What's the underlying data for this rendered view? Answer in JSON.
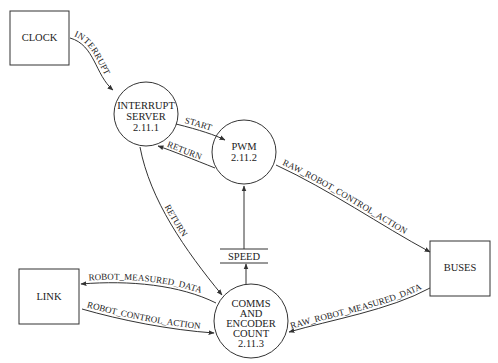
{
  "diagram": {
    "type": "data-flow-diagram",
    "terminators": {
      "clock": "CLOCK",
      "link": "LINK",
      "buses": "BUSES"
    },
    "processes": {
      "interrupt_server": {
        "line1": "INTERRUPT",
        "line2": "SERVER",
        "id": "2.11.1"
      },
      "pwm": {
        "line1": "PWM",
        "id": "2.11.2"
      },
      "comms": {
        "line1": "COMMS",
        "line2": "AND",
        "line3": "ENCODER",
        "line4": "COUNT",
        "id": "2.11.3"
      }
    },
    "stores": {
      "speed": "SPEED"
    },
    "flows": {
      "interrupt": "INTERRUPT",
      "start": "START",
      "return_pwm": "RETURN",
      "return_comms": "RETURN",
      "raw_robot_control_action": "RAW_ROBOT_CONTROL_ACTION",
      "raw_robot_measured_data": "RAW_ROBOT_MEASURED_DATA",
      "robot_measured_data": "ROBOT_MEASURED_DATA",
      "robot_control_action": "ROBOT_CONTROL_ACTION"
    },
    "colors": {
      "line": "#333333",
      "text": "#222222",
      "background": "#ffffff"
    }
  }
}
